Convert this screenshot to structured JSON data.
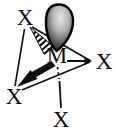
{
  "labels": {
    "metal_center": "M",
    "ligand_top_left": "X",
    "ligand_right": "X",
    "ligand_bottom_left": "X",
    "ligand_bottom_axial": "X"
  },
  "colors": {
    "ink": "#0f0f0f",
    "background": "#ffffff",
    "lobe_edge": "#000000",
    "lobe_highlight": "#e6e6e6"
  }
}
